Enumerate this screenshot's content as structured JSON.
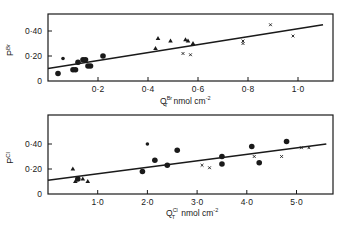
{
  "chart_data": [
    {
      "type": "scatter",
      "panel": "top",
      "ylabel": "P^Br",
      "xlabel": "Q_T^Br  nmol cm^-2",
      "xlabel_main": "Q",
      "xlabel_sup": "Br",
      "xlabel_sub": "T",
      "xlabel_unit": "nmol cm",
      "xlabel_unit_exp": "-2",
      "ylabel_main": "P",
      "ylabel_sup": "Br",
      "xlim": [
        0,
        1.15
      ],
      "ylim": [
        0,
        0.55
      ],
      "xticks": [
        0.2,
        0.4,
        0.6,
        0.8,
        1.0
      ],
      "xtick_labels": [
        "0·2",
        "0·4",
        "0·6",
        "0·8",
        "1·0"
      ],
      "yticks": [
        0,
        0.2,
        0.4
      ],
      "ytick_labels": [
        "0",
        "0·20",
        "0·40"
      ],
      "grid": false,
      "fit_line": {
        "x": [
          0,
          1.1
        ],
        "y": [
          0.1,
          0.45
        ]
      },
      "series": [
        {
          "name": "circles",
          "marker": "circle",
          "points": [
            [
              0.04,
              0.06
            ],
            [
              0.1,
              0.09
            ],
            [
              0.11,
              0.09
            ],
            [
              0.12,
              0.15
            ],
            [
              0.14,
              0.17
            ],
            [
              0.15,
              0.17
            ],
            [
              0.16,
              0.12
            ],
            [
              0.17,
              0.12
            ],
            [
              0.22,
              0.2
            ]
          ]
        },
        {
          "name": "small dots",
          "marker": "dot",
          "points": [
            [
              0.06,
              0.18
            ]
          ]
        },
        {
          "name": "triangles",
          "marker": "triangle",
          "points": [
            [
              0.43,
              0.26
            ],
            [
              0.44,
              0.34
            ],
            [
              0.49,
              0.32
            ],
            [
              0.55,
              0.33
            ],
            [
              0.56,
              0.32
            ],
            [
              0.58,
              0.3
            ]
          ]
        },
        {
          "name": "crosses",
          "marker": "cross",
          "points": [
            [
              0.54,
              0.22
            ],
            [
              0.57,
              0.21
            ],
            [
              0.78,
              0.3
            ],
            [
              0.78,
              0.32
            ],
            [
              0.89,
              0.45
            ],
            [
              0.98,
              0.36
            ]
          ]
        }
      ]
    },
    {
      "type": "scatter",
      "panel": "bottom",
      "ylabel": "P^Cl",
      "xlabel": "Q_T^Cl  nmol cm^-2",
      "xlabel_main": "Q",
      "xlabel_sup": "Cl",
      "xlabel_sub": "T",
      "xlabel_unit": "nmol cm",
      "xlabel_unit_exp": "-2",
      "ylabel_main": "P",
      "ylabel_sup": "Cl",
      "xlim": [
        0,
        57
      ],
      "ylim": [
        0,
        0.62
      ],
      "xticks": [
        10,
        20,
        30,
        40,
        50
      ],
      "xtick_labels": [
        "1·0",
        "2·0",
        "3·0",
        "4·0",
        "5·0"
      ],
      "yticks": [
        0,
        0.2,
        0.4
      ],
      "ytick_labels": [
        "0",
        "0·20",
        "0·40"
      ],
      "grid": false,
      "fit_line": {
        "x": [
          0,
          56
        ],
        "y": [
          0.11,
          0.4
        ]
      },
      "series": [
        {
          "name": "triangles",
          "marker": "triangle",
          "points": [
            [
              5,
              0.2
            ],
            [
              5.5,
              0.1
            ],
            [
              7,
              0.12
            ],
            [
              8,
              0.1
            ]
          ]
        },
        {
          "name": "circles",
          "marker": "circle",
          "points": [
            [
              6,
              0.12
            ],
            [
              19,
              0.18
            ],
            [
              21.5,
              0.27
            ],
            [
              24,
              0.23
            ],
            [
              26,
              0.35
            ],
            [
              35,
              0.3
            ],
            [
              35,
              0.24
            ],
            [
              41,
              0.38
            ],
            [
              42.5,
              0.25
            ],
            [
              48,
              0.42
            ]
          ]
        },
        {
          "name": "small dots",
          "marker": "dot",
          "points": [
            [
              20,
              0.4
            ]
          ]
        },
        {
          "name": "crosses",
          "marker": "cross",
          "points": [
            [
              31,
              0.23
            ],
            [
              32.5,
              0.21
            ],
            [
              41.5,
              0.3
            ],
            [
              47,
              0.3
            ],
            [
              51,
              0.37
            ],
            [
              52.5,
              0.37
            ]
          ]
        }
      ]
    }
  ]
}
